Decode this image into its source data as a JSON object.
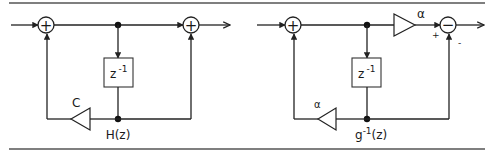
{
  "diagram": {
    "left_panel": {
      "name": "H(z) filter",
      "sum1_symbol": "+",
      "sum2_symbol": "+",
      "delay_label": "z",
      "delay_exponent": "-1",
      "feedback_gain_label": "C",
      "node_label": "H(z)"
    },
    "right_panel": {
      "name": "inverse filter",
      "sum1_symbol": "+",
      "sum2_symbol": "−",
      "forward_gain_label": "α",
      "delay_label": "z",
      "delay_exponent": "-1",
      "feedback_gain_label": "α",
      "node_label_base": "g",
      "node_label_exponent": "-1",
      "node_label_suffix": "(z)",
      "plus_sign": "+",
      "minus_sign": "-"
    }
  }
}
